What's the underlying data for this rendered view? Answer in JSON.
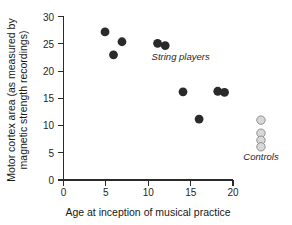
{
  "chart_data": {
    "type": "scatter",
    "title": "",
    "xlabel": "Age at inception of musical practice",
    "ylabel": "Motor cortex area (as measured by magnetic strength recordings)",
    "ylabel_line1": "Motor cortex area (as measured by",
    "ylabel_line2": "magnetic strength recordings)",
    "xlim": [
      0,
      20
    ],
    "ylim": [
      0,
      30
    ],
    "xticks": [
      0,
      5,
      10,
      15,
      20
    ],
    "yticks": [
      0,
      5,
      10,
      15,
      20,
      25,
      30
    ],
    "xtick_labels": [
      "0",
      "5",
      "10",
      "15",
      "20"
    ],
    "ytick_labels": [
      "0",
      "5",
      "10",
      "15",
      "20",
      "25",
      "30"
    ],
    "grid": false,
    "legend_position": "inline-annotation",
    "series": [
      {
        "name": "String players",
        "marker": "filled-circle",
        "color": "#2a2a2a",
        "annotation": "String players",
        "annotation_x": 10.4,
        "annotation_y": 22.1,
        "points": [
          {
            "x": 4.9,
            "y": 27.2
          },
          {
            "x": 5.9,
            "y": 23.0
          },
          {
            "x": 6.9,
            "y": 25.4
          },
          {
            "x": 11.1,
            "y": 25.1
          },
          {
            "x": 12.0,
            "y": 24.7
          },
          {
            "x": 14.1,
            "y": 16.2
          },
          {
            "x": 16.0,
            "y": 11.2
          },
          {
            "x": 18.2,
            "y": 16.3
          },
          {
            "x": 19.0,
            "y": 16.1
          }
        ]
      },
      {
        "name": "Controls",
        "marker": "open-circle",
        "color": "#d8d8d8",
        "annotation": "Controls",
        "annotation_x": 23.3,
        "annotation_y": 3.6,
        "points": [
          {
            "x": 23.3,
            "y": 11.0
          },
          {
            "x": 23.3,
            "y": 8.6
          },
          {
            "x": 23.3,
            "y": 7.3
          },
          {
            "x": 23.3,
            "y": 6.1
          }
        ]
      }
    ]
  },
  "figure": {
    "background_color": "#ffffff",
    "axis_color": "#2b2b2b",
    "text_color": "#1a1a1a"
  }
}
